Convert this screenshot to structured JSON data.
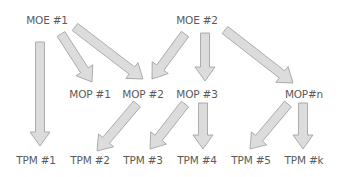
{
  "diagram": {
    "type": "hierarchy",
    "arrow_fill": "#dcdcdc",
    "arrow_stroke": "#9a9a9a",
    "text_color": "#5a5a5a",
    "nodes": [
      {
        "id": "moe1",
        "label": "MOE #1",
        "level": "MOE",
        "x": 47,
        "y": 20
      },
      {
        "id": "moe2",
        "label": "MOE #2",
        "level": "MOE",
        "x": 197,
        "y": 20
      },
      {
        "id": "mop1",
        "label": "MOP #1",
        "level": "MOP",
        "x": 90,
        "y": 94
      },
      {
        "id": "mop2",
        "label": "MOP #2",
        "level": "MOP",
        "x": 143,
        "y": 94
      },
      {
        "id": "mop3",
        "label": "MOP #3",
        "level": "MOP",
        "x": 197,
        "y": 94
      },
      {
        "id": "mopn",
        "label": "MOP#n",
        "level": "MOP",
        "x": 304,
        "y": 94
      },
      {
        "id": "tpm1",
        "label": "TPM #1",
        "level": "TPM",
        "x": 36,
        "y": 160
      },
      {
        "id": "tpm2",
        "label": "TPM #2",
        "level": "TPM",
        "x": 90,
        "y": 160
      },
      {
        "id": "tpm3",
        "label": "TPM #3",
        "level": "TPM",
        "x": 143,
        "y": 160
      },
      {
        "id": "tpm4",
        "label": "TPM #4",
        "level": "TPM",
        "x": 197,
        "y": 160
      },
      {
        "id": "tpm5",
        "label": "TPM #5",
        "level": "TPM",
        "x": 251,
        "y": 160
      },
      {
        "id": "tpmk",
        "label": "TPM #k",
        "level": "TPM",
        "x": 304,
        "y": 160
      }
    ],
    "edges": [
      {
        "from": "moe1",
        "to": "tpm1",
        "x1": 40,
        "y1": 42,
        "x2": 40,
        "y2": 146
      },
      {
        "from": "moe1",
        "to": "mop1",
        "x1": 61,
        "y1": 34,
        "x2": 92,
        "y2": 82
      },
      {
        "from": "moe1",
        "to": "mop2",
        "x1": 75,
        "y1": 27,
        "x2": 143,
        "y2": 79
      },
      {
        "from": "moe2",
        "to": "mop2",
        "x1": 185,
        "y1": 34,
        "x2": 152,
        "y2": 79
      },
      {
        "from": "moe2",
        "to": "mop3",
        "x1": 205,
        "y1": 33,
        "x2": 205,
        "y2": 81
      },
      {
        "from": "moe2",
        "to": "mopn",
        "x1": 225,
        "y1": 30,
        "x2": 293,
        "y2": 83
      },
      {
        "from": "mop2",
        "to": "tpm2",
        "x1": 137,
        "y1": 104,
        "x2": 97,
        "y2": 151
      },
      {
        "from": "mop3",
        "to": "tpm3",
        "x1": 185,
        "y1": 104,
        "x2": 150,
        "y2": 149
      },
      {
        "from": "mop3",
        "to": "tpm4",
        "x1": 203,
        "y1": 103,
        "x2": 203,
        "y2": 149
      },
      {
        "from": "mopn",
        "to": "tpm5",
        "x1": 288,
        "y1": 104,
        "x2": 250,
        "y2": 149
      },
      {
        "from": "mopn",
        "to": "tpmk",
        "x1": 303,
        "y1": 103,
        "x2": 303,
        "y2": 149
      }
    ]
  }
}
